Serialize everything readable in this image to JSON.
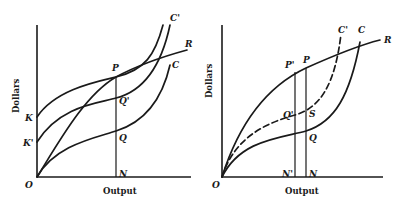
{
  "figure": {
    "left_panel": {
      "axis_labels": {
        "y": "Dollars",
        "x": "Output"
      },
      "point_labels": {
        "origin": "O",
        "K": "K",
        "K_prime": "K'",
        "P": "P",
        "Q_prime": "Q'",
        "Q": "Q",
        "N": "N",
        "R": "R",
        "C": "C",
        "C_prime": "C'"
      },
      "curves": [
        {
          "name": "R",
          "description": "total revenue curve from O through P",
          "style": "solid"
        },
        {
          "name": "C",
          "description": "variable cost curve from O through Q",
          "style": "solid"
        },
        {
          "name": "C'",
          "description": "total cost curve from K through P",
          "style": "solid"
        },
        {
          "name": "K'-curve",
          "description": "cost curve from K' through Q'",
          "style": "solid"
        }
      ],
      "vertical_line": "PN"
    },
    "right_panel": {
      "axis_labels": {
        "y": "Dollars",
        "x": "Output"
      },
      "point_labels": {
        "origin": "O",
        "P_prime": "P'",
        "P": "P",
        "Q_prime": "Q'",
        "S": "S",
        "Q": "Q",
        "N_prime": "N'",
        "N": "N",
        "R": "R",
        "C": "C",
        "C_prime": "C'"
      },
      "curves": [
        {
          "name": "R",
          "description": "revenue curve from O through P' and P",
          "style": "solid"
        },
        {
          "name": "C",
          "description": "cost curve from O through Q",
          "style": "solid"
        },
        {
          "name": "C'",
          "description": "shifted cost curve through Q' and S",
          "style": "dashed"
        }
      ],
      "vertical_lines": [
        "P'N'",
        "PN"
      ]
    }
  }
}
